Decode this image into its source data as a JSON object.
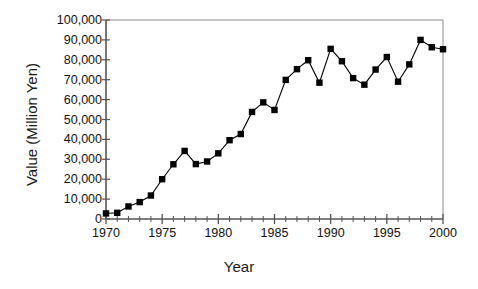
{
  "chart_data": {
    "type": "line",
    "title": "",
    "xlabel": "Year",
    "ylabel": "Value (Million Yen)",
    "xlim": [
      1970,
      2000
    ],
    "ylim": [
      0,
      100000
    ],
    "grid": false,
    "legend": null,
    "marker": "square",
    "marker_color": "#000000",
    "line_color": "#000000",
    "ytick_labels": [
      "100,000",
      "90,000",
      "80,000",
      "70,000",
      "60,000",
      "50,000",
      "40,000",
      "30,000",
      "20,000",
      "10,000",
      "0"
    ],
    "ytick_values": [
      100000,
      90000,
      80000,
      70000,
      60000,
      50000,
      40000,
      30000,
      20000,
      10000,
      0
    ],
    "xtick_labels": [
      "1970",
      "1975",
      "1980",
      "1985",
      "1990",
      "1995",
      "2000"
    ],
    "xtick_values": [
      1970,
      1975,
      1980,
      1985,
      1990,
      1995,
      2000
    ],
    "x_minor_tick_interval": 1,
    "x": [
      1970,
      1971,
      1972,
      1973,
      1974,
      1975,
      1976,
      1977,
      1978,
      1979,
      1980,
      1981,
      1982,
      1983,
      1984,
      1985,
      1986,
      1987,
      1988,
      1989,
      1990,
      1991,
      1992,
      1993,
      1994,
      1995,
      1996,
      1997,
      1998,
      1999,
      2000
    ],
    "values": [
      2800,
      3100,
      6300,
      8500,
      11800,
      20000,
      27500,
      34200,
      27600,
      28900,
      33000,
      39600,
      42700,
      53800,
      58600,
      54800,
      69900,
      75300,
      79800,
      68500,
      85500,
      79300,
      70800,
      67500,
      75100,
      81400,
      69000,
      77700,
      90000,
      86300,
      85300
    ]
  },
  "axis": {
    "y_axis_name": "value-axis",
    "x_axis_name": "year-axis"
  }
}
